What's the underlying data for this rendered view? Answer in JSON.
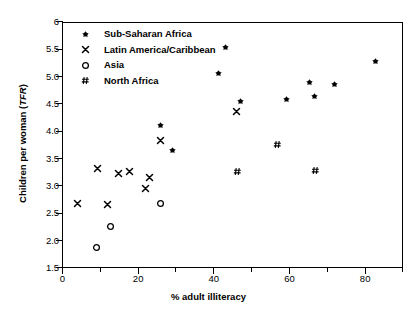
{
  "chart_data": {
    "type": "scatter",
    "title": "",
    "xlabel": "% adult illiteracy",
    "ylabel": "Children per woman (TFR)",
    "ylabel_plain": "Children per woman (",
    "ylabel_italic": "TFR",
    "ylabel_tail": ")",
    "xlim": [
      0,
      90
    ],
    "ylim": [
      1.5,
      6.0
    ],
    "grid": false,
    "legend_position": "top-left inside",
    "xticks": [
      0,
      10,
      20,
      30,
      40,
      50,
      60,
      70,
      80,
      90
    ],
    "xticklabels": [
      "0",
      "",
      "20",
      "",
      "40",
      "",
      "60",
      "",
      "80",
      ""
    ],
    "yticks": [
      1.5,
      2.0,
      2.5,
      3.0,
      3.5,
      4.0,
      4.5,
      5.0,
      5.5,
      6.0
    ],
    "yticklabels": [
      "1.5",
      "2.0",
      "2.5",
      "3.0",
      "3.5",
      "4.0",
      "4.5",
      "5.0",
      "5.5",
      "6"
    ],
    "series": [
      {
        "name": "Sub-Saharan Africa",
        "marker": "filled-star-dot",
        "color": "#000000",
        "points": [
          {
            "x": 26.0,
            "y": 4.1
          },
          {
            "x": 29.0,
            "y": 3.65
          },
          {
            "x": 41.2,
            "y": 5.05
          },
          {
            "x": 43.2,
            "y": 5.53
          },
          {
            "x": 47.0,
            "y": 4.55
          },
          {
            "x": 59.2,
            "y": 4.59
          },
          {
            "x": 65.2,
            "y": 4.9
          },
          {
            "x": 66.5,
            "y": 4.64
          },
          {
            "x": 72.0,
            "y": 4.86
          },
          {
            "x": 82.8,
            "y": 5.27
          }
        ]
      },
      {
        "name": "Latin America/Caribbean",
        "marker": "x-cross",
        "color": "#000000",
        "points": [
          {
            "x": 4.0,
            "y": 2.68
          },
          {
            "x": 9.2,
            "y": 3.32
          },
          {
            "x": 11.8,
            "y": 2.67
          },
          {
            "x": 14.8,
            "y": 3.22
          },
          {
            "x": 17.8,
            "y": 3.26
          },
          {
            "x": 22.0,
            "y": 2.96
          },
          {
            "x": 23.0,
            "y": 3.15
          },
          {
            "x": 26.0,
            "y": 3.84
          },
          {
            "x": 46.0,
            "y": 4.36
          }
        ]
      },
      {
        "name": "Asia",
        "marker": "open-circle",
        "color": "#000000",
        "points": [
          {
            "x": 9.0,
            "y": 1.88
          },
          {
            "x": 12.8,
            "y": 2.26
          },
          {
            "x": 26.0,
            "y": 2.68
          }
        ]
      },
      {
        "name": "North Africa",
        "marker": "hash",
        "color": "#000000",
        "points": [
          {
            "x": 46.2,
            "y": 3.26
          },
          {
            "x": 56.8,
            "y": 3.76
          },
          {
            "x": 67.0,
            "y": 3.29
          }
        ]
      }
    ]
  },
  "legend": {
    "items": [
      {
        "label": "Sub-Saharan Africa",
        "marker": "filled-star-dot"
      },
      {
        "label": "Latin America/Caribbean",
        "marker": "x-cross"
      },
      {
        "label": "Asia",
        "marker": "open-circle"
      },
      {
        "label": "North Africa",
        "marker": "hash"
      }
    ]
  }
}
